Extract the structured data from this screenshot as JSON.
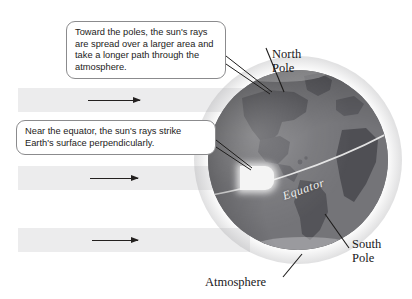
{
  "diagram": {
    "background_color": "#ffffff"
  },
  "callouts": [
    {
      "id": "poles",
      "name": "callout-poles",
      "text": "Toward the poles, the sun's rays are spread over a larger area and take a longer path through the atmosphere."
    },
    {
      "id": "equator",
      "name": "callout-equator",
      "text": "Near the equator, the sun's rays strike Earth's surface perpendicularly."
    }
  ],
  "labels": {
    "north_pole": "North\nPole",
    "north_pole_line1": "North",
    "north_pole_line2": "Pole",
    "south_pole_line1": "South",
    "south_pole_line2": "Pole",
    "atmosphere": "Atmosphere",
    "equator": "Equator"
  },
  "rays": {
    "count": 3,
    "band_color": "#ececed",
    "arrow_color": "#23201f",
    "direction": "left-to-right"
  },
  "globe": {
    "base_color": "#7d7d80",
    "land_color": "#55555a",
    "equator_line_color": "#e8e8e8",
    "atmosphere_halo_color": "#a5a5a8",
    "visible_continents": [
      "North America",
      "South America",
      "Africa",
      "Europe",
      "Greenland"
    ]
  }
}
